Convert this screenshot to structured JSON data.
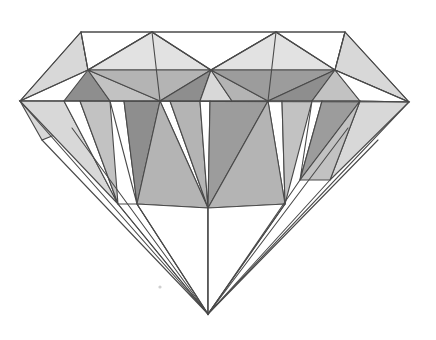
{
  "image": {
    "title": "Diamond Gemstone Line Drawing",
    "subject": "round-brilliant-cut-diamond",
    "view": "front elevation / side profile",
    "style": "hand-drawn ink line art with stippled grey shading",
    "background_color": "#ffffff",
    "width": 436,
    "height": 340
  },
  "palette": {
    "outline": "#4a4a4a",
    "white": "#ffffff",
    "light_grey": "#d8d8d8",
    "pale_grey": "#e2e2e2",
    "mid_grey": "#c2c2c2",
    "grey": "#b4b4b4",
    "dark_grey": "#9c9c9c",
    "darkest_grey": "#8e8e8e",
    "speck": "#cfcfcf"
  },
  "geometry": {
    "table_left": [
      81,
      32
    ],
    "table_right": [
      345,
      32
    ],
    "girdle_left": [
      20,
      101
    ],
    "girdle_right": [
      409,
      102
    ],
    "culet": [
      208,
      314
    ],
    "crown_peak_left": [
      152,
      32
    ],
    "crown_peak_right": [
      276,
      32
    ],
    "crown_valley_center": [
      211,
      70
    ],
    "crown_valley_left": [
      88,
      70
    ],
    "crown_valley_right": [
      335,
      70
    ]
  },
  "regions": {
    "crown": {
      "name": "Crown",
      "description": "Upper section above the girdle containing the flat table facet, star facets and bezel facets"
    },
    "girdle": {
      "name": "Girdle",
      "description": "Widest horizontal band separating the crown from the pavilion"
    },
    "pavilion": {
      "name": "Pavilion",
      "description": "Lower cone-shaped section of long triangular facets converging at the culet point"
    }
  },
  "facets": [
    {
      "id": "crown-bezel-far-left",
      "tone": "light_grey",
      "points": "81,32 20,101 88,70"
    },
    {
      "id": "crown-table-left-white",
      "tone": "white",
      "points": "81,32 152,32 88,70"
    },
    {
      "id": "crown-star-left",
      "tone": "pale_grey",
      "points": "152,32 211,70 88,70"
    },
    {
      "id": "crown-table-center-white",
      "tone": "white",
      "points": "152,32 276,32 211,70"
    },
    {
      "id": "crown-star-right",
      "tone": "pale_grey",
      "points": "276,32 335,70 211,70"
    },
    {
      "id": "crown-table-right-white",
      "tone": "white",
      "points": "276,32 345,32 335,70"
    },
    {
      "id": "crown-bezel-far-right",
      "tone": "light_grey",
      "points": "345,32 409,102 335,70"
    },
    {
      "id": "crown-lower-left-a",
      "tone": "darkest_grey",
      "points": "88,70 64,101 110,101"
    },
    {
      "id": "crown-lower-left-b",
      "tone": "mid_grey",
      "points": "88,70 110,101 160,101"
    },
    {
      "id": "crown-lower-left-c",
      "tone": "grey",
      "points": "88,70 160,101 211,70"
    },
    {
      "id": "crown-lower-center-a",
      "tone": "darkest_grey",
      "points": "211,70 160,101 200,101"
    },
    {
      "id": "crown-lower-center-b",
      "tone": "light_grey",
      "points": "211,70 200,101 232,101"
    },
    {
      "id": "crown-lower-center-c",
      "tone": "grey",
      "points": "211,70 232,101 268,101"
    },
    {
      "id": "crown-lower-right-a",
      "tone": "dark_grey",
      "points": "211,70 268,101 335,70"
    },
    {
      "id": "crown-lower-right-b",
      "tone": "darkest_grey",
      "points": "335,70 268,101 312,101"
    },
    {
      "id": "crown-lower-right-c",
      "tone": "mid_grey",
      "points": "335,70 312,101 360,101"
    },
    {
      "id": "crown-lower-far-right",
      "tone": "white",
      "points": "335,70 360,101 409,102"
    },
    {
      "id": "girdle-left-wedge",
      "tone": "light_grey",
      "points": "20,101 64,101 72,128"
    },
    {
      "id": "girdle-left-wedge-2",
      "tone": "light_grey",
      "points": "20,101 72,128 42,140"
    },
    {
      "id": "pav-1",
      "tone": "light_grey",
      "points": "20,101 64,101 118,204"
    },
    {
      "id": "pav-2",
      "tone": "white",
      "points": "64,101 80,101 118,204"
    },
    {
      "id": "pav-3",
      "tone": "mid_grey",
      "points": "80,101 110,101 118,204"
    },
    {
      "id": "pav-4",
      "tone": "white",
      "points": "110,101 124,101 137,204"
    },
    {
      "id": "pav-5",
      "tone": "darkest_grey",
      "points": "124,101 160,101 137,204"
    },
    {
      "id": "pav-6",
      "tone": "white",
      "points": "160,101 170,101 208,208"
    },
    {
      "id": "pav-7",
      "tone": "grey",
      "points": "160,101 208,208 137,204"
    },
    {
      "id": "pav-8",
      "tone": "grey",
      "points": "170,101 200,101 208,208"
    },
    {
      "id": "pav-9",
      "tone": "white",
      "points": "200,101 210,101 208,208"
    },
    {
      "id": "pav-10",
      "tone": "dark_grey",
      "points": "210,101 268,101 208,208"
    },
    {
      "id": "pav-11",
      "tone": "white",
      "points": "268,101 282,101 285,204"
    },
    {
      "id": "pav-12",
      "tone": "grey",
      "points": "268,101 285,204 208,208"
    },
    {
      "id": "pav-13",
      "tone": "mid_grey",
      "points": "282,101 312,101 285,204"
    },
    {
      "id": "pav-14",
      "tone": "white",
      "points": "312,101 322,101 300,180"
    },
    {
      "id": "pav-15",
      "tone": "dark_grey",
      "points": "322,101 360,101 300,180"
    },
    {
      "id": "pav-16",
      "tone": "light_grey",
      "points": "360,101 409,102 330,180"
    },
    {
      "id": "pav-17",
      "tone": "mid_grey",
      "points": "360,101 330,180 300,180"
    },
    {
      "id": "pav-lower-left-white",
      "tone": "white",
      "points": "118,204 137,204 208,314"
    },
    {
      "id": "pav-lower-center-white",
      "tone": "white",
      "points": "137,204 208,208 208,314"
    },
    {
      "id": "pav-lower-right-white",
      "tone": "white",
      "points": "208,208 285,204 208,314"
    }
  ],
  "outline_edges": [
    {
      "id": "girdle-line",
      "d": "M20,101 L409,102"
    },
    {
      "id": "silhouette",
      "d": "M20,101 L81,32 L345,32 L409,102 L208,314 Z"
    },
    {
      "id": "pavilion-left-long",
      "d": "M42,140 L208,314"
    },
    {
      "id": "pavilion-left-mid",
      "d": "M72,128 L208,314"
    },
    {
      "id": "pavilion-right-long",
      "d": "M378,140 L208,314"
    },
    {
      "id": "pavilion-right-mid",
      "d": "M348,128 L208,314"
    },
    {
      "id": "pavilion-culet-spoke-a",
      "d": "M118,204 L208,314"
    },
    {
      "id": "pavilion-culet-spoke-b",
      "d": "M137,204 L208,314"
    },
    {
      "id": "pavilion-culet-spoke-c",
      "d": "M208,208 L208,314"
    },
    {
      "id": "pavilion-culet-spoke-d",
      "d": "M285,204 L208,314"
    },
    {
      "id": "pavilion-culet-spoke-e",
      "d": "M300,180 L208,314"
    },
    {
      "id": "pavilion-culet-spoke-f",
      "d": "M330,180 L208,314"
    },
    {
      "id": "crown-left-inner",
      "d": "M20,101 L88,70"
    },
    {
      "id": "crown-right-inner",
      "d": "M409,102 L335,70"
    },
    {
      "id": "crown-vertical-left",
      "d": "M152,32 L160,101"
    },
    {
      "id": "crown-vertical-right",
      "d": "M276,32 L268,101"
    },
    {
      "id": "crown-zig",
      "d": "M81,32 L88,70 L152,32 L211,70 L276,32 L335,70 L345,32"
    }
  ],
  "specks": [
    {
      "id": "speck-mid-lower-left",
      "cx": 160,
      "cy": 287,
      "r": 1.6
    }
  ]
}
